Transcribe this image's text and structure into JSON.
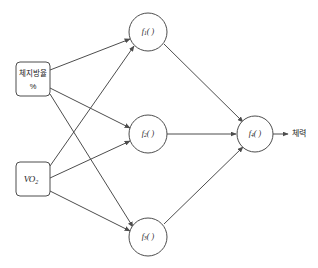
{
  "diagram": {
    "type": "feedforward-neural-network",
    "title": "",
    "canvas": {
      "width": 318,
      "height": 268,
      "background": "#ffffff"
    },
    "stroke_color": "#4d4d4d",
    "text_color": "#1a1a1a",
    "input_layer": {
      "name": "input-layer",
      "nodes": [
        {
          "id": "input-1",
          "shape": "rounded-rect",
          "label_line1": "체지방율",
          "label_line2": "%",
          "x": 16,
          "y": 62,
          "w": 34,
          "h": 34
        },
        {
          "id": "input-2",
          "shape": "rounded-rect",
          "label_main": "VO",
          "label_sub": "2",
          "x": 16,
          "y": 162,
          "w": 34,
          "h": 34
        }
      ]
    },
    "hidden_layer": {
      "name": "hidden-layer",
      "nodes": [
        {
          "id": "hidden-1",
          "label_main": "f",
          "label_sub": "1",
          "label_tail": "( )",
          "cx": 148,
          "cy": 32,
          "r": 19
        },
        {
          "id": "hidden-2",
          "label_main": "f",
          "label_sub": "2",
          "label_tail": "( )",
          "cx": 148,
          "cy": 134,
          "r": 19
        },
        {
          "id": "hidden-3",
          "label_main": "f",
          "label_sub": "3",
          "label_tail": "( )",
          "cx": 148,
          "cy": 237,
          "r": 19
        }
      ]
    },
    "output_layer": {
      "name": "output-layer",
      "nodes": [
        {
          "id": "output-1",
          "label_main": "f",
          "label_sub": "4",
          "label_tail": "( )",
          "cx": 255,
          "cy": 134,
          "r": 18
        }
      ],
      "output_label": "체력",
      "output_label_x": 292,
      "output_label_y": 134
    },
    "edges": [
      {
        "id": "e-in1-h1",
        "from": "input-1",
        "to": "hidden-1",
        "x1": 50,
        "y1": 70,
        "x2": 130,
        "y2": 39
      },
      {
        "id": "e-in1-h2",
        "from": "input-1",
        "to": "hidden-2",
        "x1": 50,
        "y1": 88,
        "x2": 130,
        "y2": 128
      },
      {
        "id": "e-in1-h3",
        "from": "input-1",
        "to": "hidden-3",
        "x1": 50,
        "y1": 94,
        "x2": 131,
        "y2": 230
      },
      {
        "id": "e-in2-h1",
        "from": "input-2",
        "to": "hidden-1",
        "x1": 50,
        "y1": 166,
        "x2": 135,
        "y2": 48
      },
      {
        "id": "e-in2-h2",
        "from": "input-2",
        "to": "hidden-2",
        "x1": 50,
        "y1": 178,
        "x2": 130,
        "y2": 141
      },
      {
        "id": "e-in2-h3",
        "from": "input-2",
        "to": "hidden-3",
        "x1": 50,
        "y1": 191,
        "x2": 130,
        "y2": 231
      },
      {
        "id": "e-h1-out",
        "from": "hidden-1",
        "to": "output-1",
        "x1": 165,
        "y1": 44,
        "x2": 244,
        "y2": 123
      },
      {
        "id": "e-h2-out",
        "from": "hidden-2",
        "to": "output-1",
        "x1": 167,
        "y1": 134,
        "x2": 237,
        "y2": 134
      },
      {
        "id": "e-h3-out",
        "from": "hidden-3",
        "to": "output-1",
        "x1": 165,
        "y1": 225,
        "x2": 244,
        "y2": 146
      },
      {
        "id": "e-out-label",
        "from": "output-1",
        "to": "output-label",
        "x1": 273,
        "y1": 134,
        "x2": 288,
        "y2": 134
      }
    ]
  }
}
